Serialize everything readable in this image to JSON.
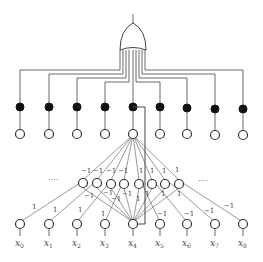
{
  "diagram": {
    "type": "network-diagram",
    "output_gate": {
      "kind": "OR-gate",
      "inputs": 9
    },
    "filled_nodes": 9,
    "upper_open_nodes": 9,
    "middle_layer": {
      "node_count": 8,
      "ellipsis_left": "····",
      "ellipsis_right": "····",
      "top_weights": [
        "−1",
        "−1",
        "−1",
        "−1",
        "1",
        "1",
        "1",
        "1"
      ]
    },
    "input_layer": {
      "labels": [
        {
          "base": "x",
          "sub": "0"
        },
        {
          "base": "x",
          "sub": "1"
        },
        {
          "base": "x",
          "sub": "2"
        },
        {
          "base": "x",
          "sub": "3"
        },
        {
          "base": "x",
          "sub": "4"
        },
        {
          "base": "x",
          "sub": "5"
        },
        {
          "base": "x",
          "sub": "6"
        },
        {
          "base": "x",
          "sub": "7"
        },
        {
          "base": "x",
          "sub": "8"
        }
      ],
      "weights_left": [
        "1",
        "1",
        "1",
        "1"
      ],
      "weights_right": [
        "−1",
        "−1",
        "−1",
        "−1"
      ]
    },
    "inner_weights": [
      "−1",
      "−1",
      "−1",
      "−1",
      "1",
      "1",
      "1",
      "1"
    ]
  }
}
